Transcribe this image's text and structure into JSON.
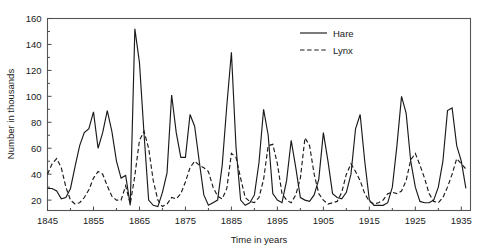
{
  "chart_data": {
    "type": "line",
    "title": "",
    "xlabel": "Time in years",
    "ylabel": "Number in thousands",
    "xlim": [
      1845,
      1937
    ],
    "ylim": [
      12,
      160
    ],
    "grid": false,
    "legend_position": "top-right",
    "xticks": [
      1845,
      1855,
      1865,
      1875,
      1885,
      1895,
      1905,
      1915,
      1925,
      1935
    ],
    "yticks": [
      20,
      40,
      60,
      80,
      100,
      120,
      140,
      160
    ],
    "x": [
      1845,
      1846,
      1847,
      1848,
      1849,
      1850,
      1851,
      1852,
      1853,
      1854,
      1855,
      1856,
      1857,
      1858,
      1859,
      1860,
      1861,
      1862,
      1863,
      1864,
      1865,
      1866,
      1867,
      1868,
      1869,
      1870,
      1871,
      1872,
      1873,
      1874,
      1875,
      1876,
      1877,
      1878,
      1879,
      1880,
      1881,
      1882,
      1883,
      1884,
      1885,
      1886,
      1887,
      1888,
      1889,
      1890,
      1891,
      1892,
      1893,
      1894,
      1895,
      1896,
      1897,
      1898,
      1899,
      1900,
      1901,
      1902,
      1903,
      1904,
      1905,
      1906,
      1907,
      1908,
      1909,
      1910,
      1911,
      1912,
      1913,
      1914,
      1915,
      1916,
      1917,
      1918,
      1919,
      1920,
      1921,
      1922,
      1923,
      1924,
      1925,
      1926,
      1927,
      1928,
      1929,
      1930,
      1931,
      1932,
      1933,
      1934,
      1935,
      1936
    ],
    "series": [
      {
        "name": "Hare",
        "style": "solid",
        "values": [
          29,
          29,
          27,
          21,
          22,
          29,
          46,
          62,
          72,
          75,
          88,
          60,
          72,
          89,
          73,
          50,
          37,
          39,
          16,
          152,
          126,
          71,
          20,
          16,
          15,
          26,
          41,
          101,
          72,
          53,
          53,
          86,
          77,
          50,
          24,
          16,
          18,
          20,
          47,
          93,
          134,
          61,
          20,
          16,
          18,
          24,
          49,
          90,
          70,
          25,
          20,
          18,
          35,
          66,
          45,
          22,
          20,
          19,
          24,
          36,
          72,
          50,
          25,
          22,
          21,
          26,
          40,
          75,
          86,
          50,
          20,
          16,
          16,
          16,
          18,
          30,
          62,
          100,
          87,
          50,
          30,
          19,
          18,
          18,
          20,
          30,
          50,
          89,
          91,
          62,
          50,
          29
        ]
      },
      {
        "name": "Lynx",
        "style": "dashed",
        "values": [
          40,
          48,
          52,
          45,
          30,
          20,
          17,
          18,
          22,
          28,
          37,
          42,
          40,
          31,
          23,
          20,
          20,
          31,
          17,
          39,
          66,
          73,
          60,
          35,
          20,
          15,
          17,
          22,
          21,
          25,
          34,
          45,
          50,
          47,
          45,
          42,
          30,
          23,
          21,
          29,
          56,
          53,
          37,
          22,
          19,
          18,
          22,
          36,
          62,
          63,
          48,
          25,
          20,
          18,
          24,
          37,
          68,
          62,
          40,
          25,
          20,
          17,
          18,
          19,
          26,
          40,
          48,
          42,
          35,
          25,
          19,
          17,
          18,
          20,
          25,
          26,
          25,
          27,
          35,
          51,
          56,
          47,
          37,
          25,
          19,
          18,
          22,
          30,
          40,
          52,
          48,
          44
        ]
      }
    ],
    "legend": [
      {
        "label": "Hare",
        "style": "solid"
      },
      {
        "label": "Lynx",
        "style": "dashed"
      }
    ]
  }
}
